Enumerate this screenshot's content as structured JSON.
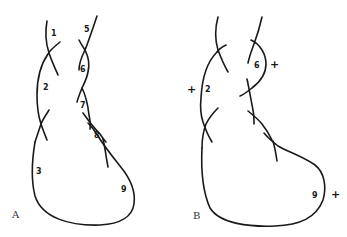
{
  "figure": {
    "panels": [
      {
        "id": "A",
        "label": "A",
        "region_numbers": [
          "1",
          "2",
          "3",
          "5",
          "6",
          "7",
          "8",
          "9"
        ],
        "signs": []
      },
      {
        "id": "B",
        "label": "B",
        "region_numbers": [
          "2",
          "6",
          "9"
        ],
        "signs": [
          "+",
          "+",
          "+"
        ]
      }
    ]
  },
  "panelA": {
    "label": "A",
    "n1": "1",
    "n2": "2",
    "n3": "3",
    "n5": "5",
    "n6": "6",
    "n7": "7",
    "n8": "8",
    "n9": "9"
  },
  "panelB": {
    "label": "B",
    "n2": "2",
    "n6": "6",
    "n9": "9",
    "plus_left": "+",
    "plus_right_6": "+",
    "plus_right_9": "+"
  },
  "colors": {
    "stroke": "#1a1a1a",
    "background": "#ffffff"
  }
}
